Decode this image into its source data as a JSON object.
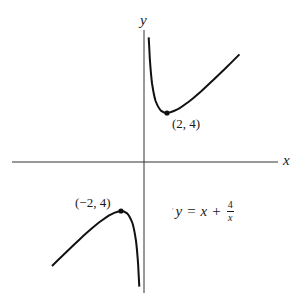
{
  "axes": {
    "x_label": "x",
    "y_label": "y",
    "origin_px": [
      144,
      162
    ],
    "scale_px_per_unit": {
      "x": 11.5,
      "y": 12.25
    }
  },
  "equation": {
    "lhs": "y",
    "equals": "=",
    "term": "x",
    "plus": "+",
    "frac_num": "4",
    "frac_den": "x",
    "stray_mark": "'",
    "text": "y = x + 4/x"
  },
  "points": [
    {
      "label": "(2, 4)",
      "x": 2,
      "y": 4,
      "kind": "local minimum"
    },
    {
      "label": "(−2, 4)",
      "x": -2,
      "y": 4,
      "kind": "local maximum"
    }
  ],
  "colors": {
    "curve": "#111111",
    "axis": "#333333",
    "background": "#ffffff"
  },
  "curve": {
    "function": "y = x + 4/x",
    "upper_branch": [
      [
        0.41,
        10.17
      ],
      [
        0.5,
        8.5
      ],
      [
        0.7,
        6.41
      ],
      [
        1,
        5
      ],
      [
        1.5,
        4.17
      ],
      [
        2,
        4
      ],
      [
        3,
        4.33
      ],
      [
        4,
        5
      ],
      [
        5,
        5.8
      ],
      [
        6,
        6.67
      ],
      [
        7,
        7.57
      ],
      [
        8.3,
        8.78
      ]
    ],
    "lower_branch": [
      [
        -0.43,
        -9.73
      ],
      [
        -0.5,
        -8.5
      ],
      [
        -0.7,
        -6.41
      ],
      [
        -1,
        -5
      ],
      [
        -1.5,
        -4.17
      ],
      [
        -2,
        -4
      ],
      [
        -3,
        -4.33
      ],
      [
        -4,
        -5
      ],
      [
        -5,
        -5.8
      ],
      [
        -6,
        -6.67
      ],
      [
        -7,
        -7.57
      ],
      [
        -8,
        -8.5
      ]
    ]
  }
}
